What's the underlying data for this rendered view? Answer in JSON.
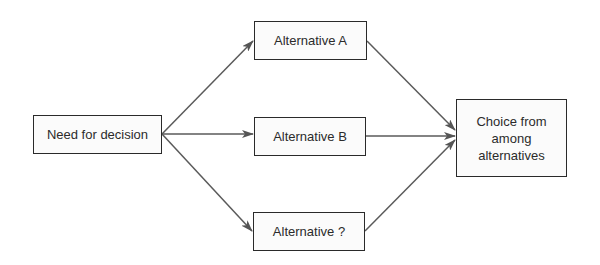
{
  "diagram": {
    "title": "",
    "colors": {
      "stroke": "#5a5a5a",
      "box_border": "#2a2a2a",
      "box_fill": "#fbfbfb",
      "text": "#2b2b2b",
      "background": "#ffffff"
    },
    "nodes": [
      {
        "id": "need",
        "label": "Need for decision"
      },
      {
        "id": "alt_a",
        "label": "Alternative A"
      },
      {
        "id": "alt_b",
        "label": "Alternative B"
      },
      {
        "id": "alt_q",
        "label": "Alternative ?"
      },
      {
        "id": "choice",
        "label": "Choice from\namong\nalternatives"
      }
    ],
    "edges": [
      {
        "from": "need",
        "to": "alt_a"
      },
      {
        "from": "need",
        "to": "alt_b"
      },
      {
        "from": "need",
        "to": "alt_q"
      },
      {
        "from": "alt_a",
        "to": "choice"
      },
      {
        "from": "alt_b",
        "to": "choice"
      },
      {
        "from": "alt_q",
        "to": "choice"
      }
    ]
  }
}
